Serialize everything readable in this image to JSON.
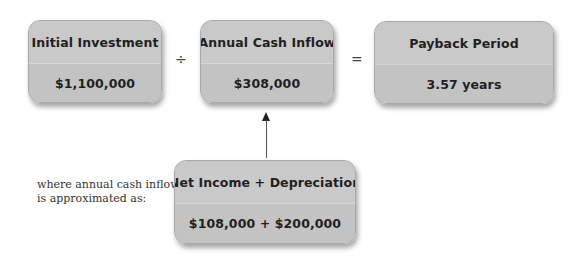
{
  "formula": {
    "boxes": [
      {
        "title": "Initial Investment",
        "value": "$1,100,000"
      },
      {
        "title": "Annual Cash Inflow",
        "value": "$308,000"
      },
      {
        "title": "Payback Period",
        "value": "3.57 years"
      }
    ],
    "operators": {
      "divide": "÷",
      "equals": "="
    }
  },
  "sub_formula": {
    "note_line1": "where annual cash inflow",
    "note_line2": "is approximated as:",
    "title": "Net Income + Depreciation",
    "value": "$108,000 + $200,000"
  },
  "colors": {
    "box_fill": "#c6c6c6",
    "box_border": "#a9a9a9",
    "text": "#1f1f1f",
    "arrow": "#333333"
  }
}
